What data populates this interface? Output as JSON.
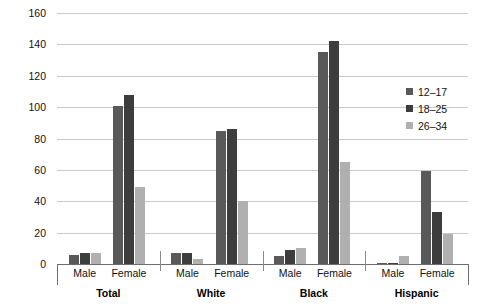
{
  "chart_data": {
    "type": "bar",
    "title": "",
    "xlabel": "",
    "ylabel": "",
    "ylim": [
      0,
      160
    ],
    "yticks": [
      0,
      20,
      40,
      60,
      80,
      100,
      120,
      140,
      160
    ],
    "grid": true,
    "legend_position": "right",
    "legend_entries": [
      "12–17",
      "18–25",
      "26–34"
    ],
    "series": [
      {
        "name": "12–17",
        "color": "#595959",
        "values": [
          6,
          101,
          7,
          85,
          5,
          135,
          0.5,
          59
        ]
      },
      {
        "name": "18–25",
        "color": "#3d3d3d",
        "values": [
          7,
          108,
          7,
          86,
          9,
          142,
          0.5,
          33
        ]
      },
      {
        "name": "26–34",
        "color": "#b0b0b0",
        "values": [
          7,
          49,
          3,
          40,
          10,
          65,
          5,
          19
        ]
      }
    ],
    "categories": [
      "Total – Male",
      "Total – Female",
      "White – Male",
      "White – Female",
      "Black – Male",
      "Black – Female",
      "Hispanic – Male",
      "Hispanic – Female"
    ],
    "group_labels": [
      "Total",
      "White",
      "Black",
      "Hispanic"
    ],
    "sex_labels": [
      "Male",
      "Female",
      "Male",
      "Female",
      "Male",
      "Female",
      "Male",
      "Female"
    ]
  }
}
